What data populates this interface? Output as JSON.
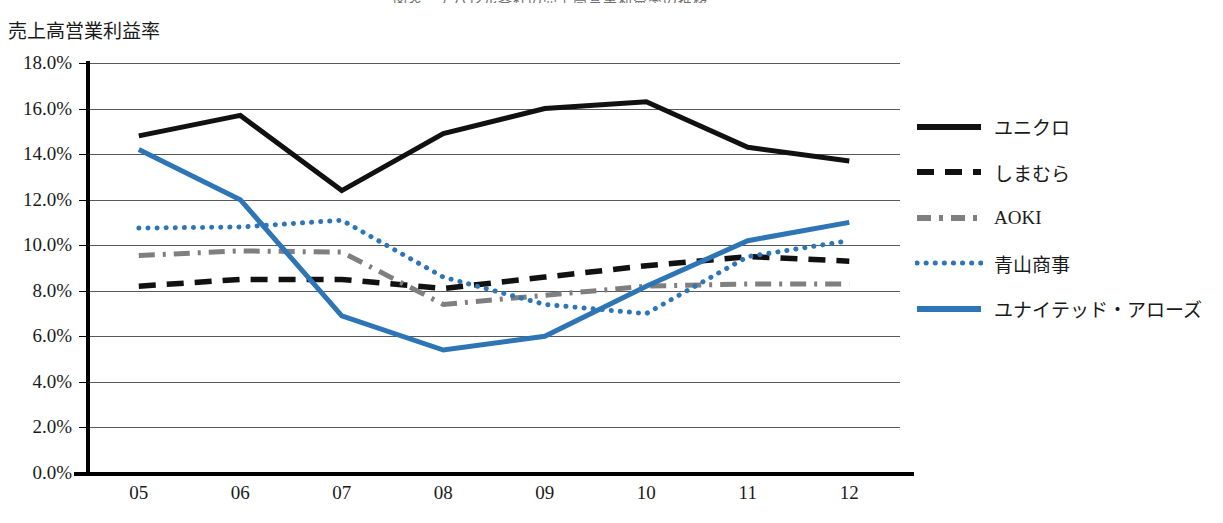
{
  "axis_title": "売上高営業利益率",
  "title_sliver": "図表　アパレル各社の売上高営業利益率の推移",
  "colors": {
    "black": "#111111",
    "gray": "#7f7f7f",
    "blue": "#2E75B6",
    "gridline": "#58595b"
  },
  "chart_data": {
    "type": "line",
    "title": "売上高営業利益率",
    "xlabel": "",
    "ylabel": "売上高営業利益率",
    "ylim": [
      0,
      18
    ],
    "ytick_labels": [
      "18.0%",
      "16.0%",
      "14.0%",
      "12.0%",
      "10.0%",
      "8.0%",
      "6.0%",
      "4.0%",
      "2.0%",
      "0.0%"
    ],
    "ytick_values": [
      18,
      16,
      14,
      12,
      10,
      8,
      6,
      4,
      2,
      0
    ],
    "grid": true,
    "legend_position": "right",
    "categories": [
      "05",
      "06",
      "07",
      "08",
      "09",
      "10",
      "11",
      "12"
    ],
    "series": [
      {
        "name": "ユニクロ",
        "style": "solid",
        "color": "#111111",
        "values": [
          14.8,
          15.7,
          12.4,
          14.9,
          16.0,
          16.3,
          14.3,
          13.7
        ]
      },
      {
        "name": "しまむら",
        "style": "dashed",
        "color": "#111111",
        "values": [
          8.2,
          8.5,
          8.5,
          8.1,
          8.6,
          9.1,
          9.5,
          9.3
        ]
      },
      {
        "name": "AOKI",
        "style": "dash-dot",
        "color": "#7f7f7f",
        "values": [
          9.55,
          9.75,
          9.7,
          7.4,
          7.8,
          8.2,
          8.3,
          8.3
        ]
      },
      {
        "name": "青山商事",
        "style": "dotted",
        "color": "#2E75B6",
        "values": [
          10.75,
          10.8,
          11.1,
          8.6,
          7.4,
          7.0,
          9.5,
          10.2
        ]
      },
      {
        "name": "ユナイテッド・アローズ",
        "style": "solid",
        "color": "#2E75B6",
        "values": [
          14.2,
          12.0,
          6.9,
          5.4,
          6.0,
          8.2,
          10.2,
          11.0
        ]
      }
    ]
  }
}
